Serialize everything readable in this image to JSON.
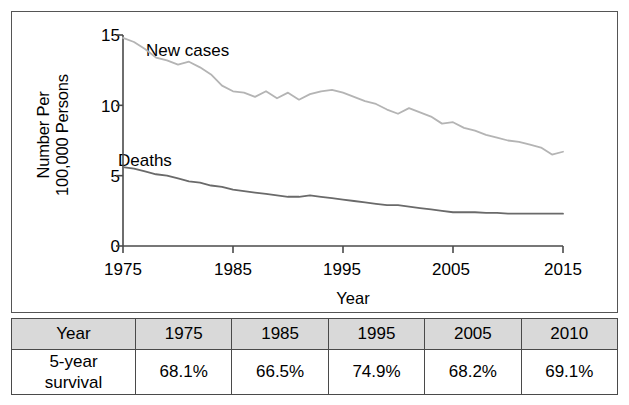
{
  "figure": {
    "y_axis_title_line1": "Number Per",
    "y_axis_title_line2": "100,000 Persons",
    "x_axis_title": "Year",
    "label_new_cases": "New cases",
    "label_deaths": "Deaths"
  },
  "colors": {
    "new_cases_line": "#b4b4b4",
    "deaths_line": "#6a6a6a",
    "axis": "#4a4a4a",
    "frame": "#555555",
    "table_header_bg": "#d9d9d9"
  },
  "table": {
    "header": [
      "Year",
      "1975",
      "1985",
      "1995",
      "2005",
      "2010"
    ],
    "row_label": "5-year\nsurvival",
    "row_label_line1": "5-year",
    "row_label_line2": "survival",
    "values": [
      "68.1%",
      "66.5%",
      "74.9%",
      "68.2%",
      "69.1%"
    ]
  },
  "chart_data": {
    "type": "line",
    "title": "",
    "xlabel": "Year",
    "ylabel": "Number Per 100,000 Persons",
    "xlim": [
      1975,
      2015
    ],
    "ylim": [
      0,
      15
    ],
    "xticks": [
      1975,
      1985,
      1995,
      2005,
      2015
    ],
    "yticks": [
      0,
      5,
      10,
      15
    ],
    "grid": false,
    "legend": "inline-annotations",
    "x": [
      1975,
      1976,
      1977,
      1978,
      1979,
      1980,
      1981,
      1982,
      1983,
      1984,
      1985,
      1986,
      1987,
      1988,
      1989,
      1990,
      1991,
      1992,
      1993,
      1994,
      1995,
      1996,
      1997,
      1998,
      1999,
      2000,
      2001,
      2002,
      2003,
      2004,
      2005,
      2006,
      2007,
      2008,
      2009,
      2010,
      2011,
      2012,
      2013,
      2014,
      2015
    ],
    "series": [
      {
        "name": "New cases",
        "color": "#b4b4b4",
        "values": [
          14.8,
          14.5,
          14.0,
          13.4,
          13.2,
          12.9,
          13.1,
          12.7,
          12.2,
          11.4,
          11.0,
          10.9,
          10.6,
          11.0,
          10.5,
          10.9,
          10.4,
          10.8,
          11.0,
          11.1,
          10.9,
          10.6,
          10.3,
          10.1,
          9.7,
          9.4,
          9.8,
          9.5,
          9.2,
          8.7,
          8.8,
          8.4,
          8.2,
          7.9,
          7.7,
          7.5,
          7.4,
          7.2,
          7.0,
          6.5,
          6.7
        ]
      },
      {
        "name": "Deaths",
        "color": "#6a6a6a",
        "values": [
          5.6,
          5.5,
          5.3,
          5.1,
          5.0,
          4.8,
          4.6,
          4.5,
          4.3,
          4.2,
          4.0,
          3.9,
          3.8,
          3.7,
          3.6,
          3.5,
          3.5,
          3.6,
          3.5,
          3.4,
          3.3,
          3.2,
          3.1,
          3.0,
          2.9,
          2.9,
          2.8,
          2.7,
          2.6,
          2.5,
          2.4,
          2.4,
          2.4,
          2.35,
          2.35,
          2.3,
          2.3,
          2.3,
          2.3,
          2.3,
          2.3
        ]
      }
    ]
  }
}
